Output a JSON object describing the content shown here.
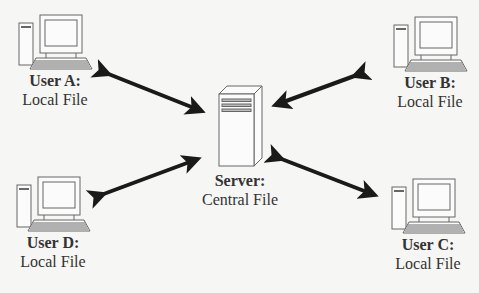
{
  "diagram": {
    "type": "client-server file sharing",
    "server": {
      "title": "Server:",
      "subtitle": "Central File",
      "icon": "server-tower-icon"
    },
    "users": [
      {
        "id": "A",
        "title": "User A:",
        "subtitle": "Local File",
        "icon": "desktop-computer-icon"
      },
      {
        "id": "B",
        "title": "User B:",
        "subtitle": "Local File",
        "icon": "desktop-computer-icon"
      },
      {
        "id": "C",
        "title": "User C:",
        "subtitle": "Local File",
        "icon": "desktop-computer-icon"
      },
      {
        "id": "D",
        "title": "User D:",
        "subtitle": "Local File",
        "icon": "desktop-computer-icon"
      }
    ],
    "edges": [
      {
        "from": "User A",
        "to": "Server",
        "direction": "bidirectional"
      },
      {
        "from": "User B",
        "to": "Server",
        "direction": "bidirectional"
      },
      {
        "from": "User C",
        "to": "Server",
        "direction": "bidirectional"
      },
      {
        "from": "User D",
        "to": "Server",
        "direction": "bidirectional"
      }
    ],
    "colors": {
      "background": "#f6f6f4",
      "arrow": "#1a1a1a",
      "icon_stroke": "#555555",
      "text": "#333333"
    }
  }
}
